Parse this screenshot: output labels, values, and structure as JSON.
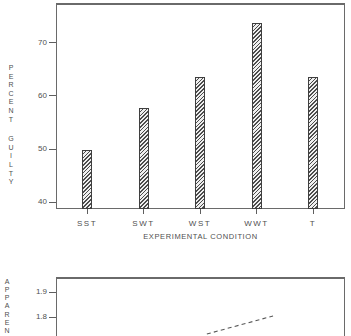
{
  "figure": {
    "background": "#ffffff",
    "line_color": "#6a6a6a",
    "text_color": "#4f4f4f",
    "bar_outline_color": "#3f3f3f",
    "bar_hatch_color": "#4c4c4c"
  },
  "chart_data": [
    {
      "type": "bar",
      "title": "",
      "ylabel": "PERCENT GUILTY",
      "xlabel": "EXPERIMENTAL CONDITION",
      "categories": [
        "SST",
        "SWT",
        "WST",
        "WWT",
        "T"
      ],
      "values": [
        49.9,
        57.7,
        63.5,
        73.8,
        63.5
      ],
      "yticks": [
        70,
        60,
        50,
        40
      ],
      "ylim": [
        38.7,
        77.5
      ],
      "grid": false,
      "bar_hatch": "diagonal",
      "legend": "none"
    },
    {
      "type": "line",
      "title": "",
      "ylabel_visible": "APPAREN",
      "yticks": [
        1.9,
        1.8
      ],
      "ylim_visible": [
        1.724,
        1.96
      ],
      "line_style": "dashed",
      "truncated_at_image_bottom": true,
      "visible_segment": {
        "x_frac": [
          0.522,
          0.751
        ],
        "y": [
          1.732,
          1.804
        ]
      }
    }
  ]
}
